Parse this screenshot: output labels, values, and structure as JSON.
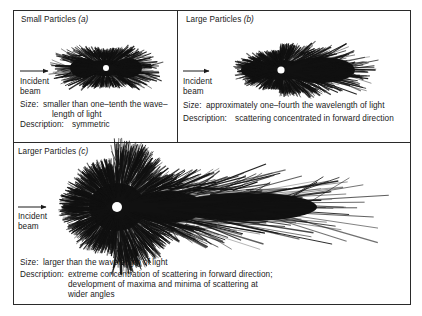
{
  "panels": [
    {
      "id": "a",
      "title": "Small Particles",
      "label": "(a)",
      "incident": [
        "Incident",
        "beam"
      ],
      "size_label": "Size:",
      "size_lines": [
        "smaller than one–tenth the wave–",
        "length of light"
      ],
      "description_label": "Description:",
      "description_lines": [
        "symmetric"
      ]
    },
    {
      "id": "b",
      "title": "Large Particles",
      "label": "(b)",
      "incident": [
        "Incident",
        "beam"
      ],
      "size_label": "Size:",
      "size_lines": [
        "approximately one–fourth the wavelength of light"
      ],
      "description_label": "Description:",
      "description_lines": [
        "scattering concentrated in forward direction"
      ]
    },
    {
      "id": "c",
      "title": "Larger Particles",
      "label": "(c)",
      "incident": [
        "Incident",
        "beam"
      ],
      "size_label": "Size:",
      "size_lines": [
        "larger than the wavelength of light"
      ],
      "description_label": "Description:",
      "description_lines": [
        "extreme concentration of scattering in forward direction;",
        "development of maxima and minima of scattering at",
        "wider angles"
      ]
    }
  ],
  "icons": {
    "beam_arrow": "right-arrow",
    "particle": "white-dot"
  },
  "colors": {
    "ink": "#1a1a1a",
    "paper": "#ffffff"
  }
}
